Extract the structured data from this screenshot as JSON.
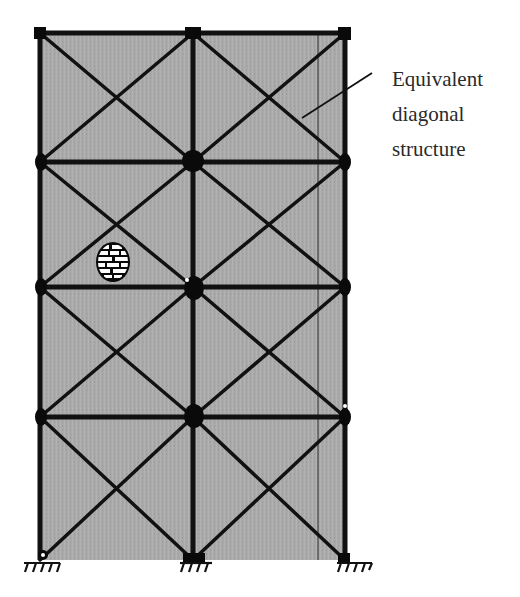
{
  "annotation": {
    "lines": [
      "Equivalent",
      "diagonal",
      "structure"
    ]
  },
  "frame": {
    "columns_x": [
      40,
      193,
      345
    ],
    "floors_y": [
      33,
      162,
      287,
      417,
      560
    ],
    "panel_fill": "#a9a9a9",
    "member_color": "#111111",
    "storeys": 4,
    "bays": 2,
    "supports": "fixed",
    "bracing": "cross-diagonal in every panel"
  },
  "leader_line": {
    "from": [
      372,
      73
    ],
    "to": [
      302,
      118
    ]
  },
  "infill_symbol": {
    "type": "masonry-brick-ellipse",
    "cx": 113,
    "cy": 262,
    "rx": 17,
    "ry": 20
  },
  "thin_line_x": 318,
  "colors": {
    "background": "#ffffff",
    "text": "#2a2a2a"
  }
}
